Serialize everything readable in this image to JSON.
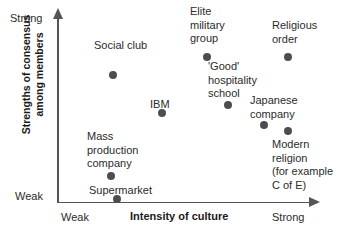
{
  "chart_data": {
    "type": "scatter",
    "title": "",
    "xlabel": "Intensity of culture",
    "ylabel": "Strengths of consensus\namong members",
    "xlim": [
      0,
      10
    ],
    "ylim": [
      0,
      10
    ],
    "grid": false,
    "legend_position": "none",
    "x_ticks": [
      "Weak",
      "Strong"
    ],
    "y_ticks": [
      "Weak",
      "Strong"
    ],
    "points": [
      {
        "label": "Social club",
        "x": 2.2,
        "y": 6.9,
        "px": 113,
        "py": 75,
        "lx": 94,
        "ly": 39
      },
      {
        "label": "Mass\nproduction\ncompany",
        "x": 2.1,
        "y": 1.4,
        "px": 111,
        "py": 176,
        "lx": 87,
        "ly": 130
      },
      {
        "label": "Supermarket",
        "x": 2.4,
        "y": 0.2,
        "px": 117,
        "py": 199,
        "lx": 89,
        "ly": 184
      },
      {
        "label": "IBM",
        "x": 4.3,
        "y": 4.2,
        "px": 162,
        "py": 113,
        "lx": 150,
        "ly": 98
      },
      {
        "label": "Elite\nmilitary\ngroup",
        "x": 6.1,
        "y": 8.4,
        "px": 207,
        "py": 57,
        "lx": 190,
        "ly": 5
      },
      {
        "label": "'Good'\nhospitality\nschool",
        "x": 6.9,
        "y": 5.7,
        "px": 228,
        "py": 105,
        "lx": 208,
        "ly": 60
      },
      {
        "label": "Japanese\ncompany",
        "x": 8.4,
        "y": 3.6,
        "px": 264,
        "py": 125,
        "lx": 250,
        "ly": 94
      },
      {
        "label": "Religious\norder",
        "x": 9.4,
        "y": 8.4,
        "px": 288,
        "py": 57,
        "lx": 272,
        "ly": 19
      },
      {
        "label": "Modern\nreligion\n(for example\nC of E)",
        "x": 9.4,
        "y": 3.3,
        "px": 288,
        "py": 131,
        "lx": 272,
        "ly": 138
      }
    ]
  },
  "axes": {
    "x_title": "Intensity of culture",
    "y_title": "Strengths of consensus\namong members",
    "x_tick_low": "Weak",
    "x_tick_high": "Strong",
    "y_tick_low": "Weak",
    "y_tick_high": "Strong"
  },
  "colors": {
    "dot": "#4d4d4d",
    "axis": "#555555",
    "text": "#2b2b2b",
    "title_text": "#1a1a1a",
    "background": "#ffffff"
  }
}
